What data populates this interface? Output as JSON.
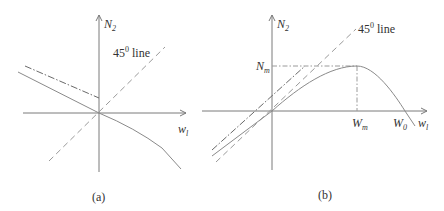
{
  "panels": [
    {
      "id": "a",
      "caption": "(a)",
      "y_axis_label": "N",
      "y_axis_sub": "2",
      "x_axis_label": "w",
      "x_axis_sub": "l",
      "line_label_base": "45",
      "line_label_sup": "0",
      "line_label_text": " line"
    },
    {
      "id": "b",
      "caption": "(b)",
      "y_axis_label": "N",
      "y_axis_sub": "2",
      "x_axis_label": "w",
      "x_axis_sub": "l",
      "line_label_base": "45",
      "line_label_sup": "0",
      "line_label_text": " line",
      "peak_y_label": "N",
      "peak_y_sub": "m",
      "peak_x_label": "W",
      "peak_x_sub": "m",
      "zero_x_label": "W",
      "zero_x_sub": "0"
    }
  ],
  "colors": {
    "axis": "#7a7a7a",
    "curve": "#8a8a8a",
    "text": "#333333"
  }
}
